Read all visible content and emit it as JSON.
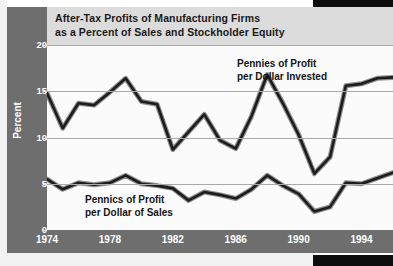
{
  "chart_title": "After-Tax Profits of Manufacturing Firms\nas a Percent of Sales and Stockholder Equity",
  "axis": {
    "y_title": "Percent",
    "y_ticks": [
      "0",
      "5",
      "10",
      "15",
      "20"
    ],
    "x_ticks": [
      "1974",
      "1978",
      "1982",
      "1986",
      "1990",
      "1994",
      "199"
    ]
  },
  "annotations": {
    "equity": "Pennies of Profit\nper Dollar Invested",
    "sales": "Pennics of Profit\nper Dollar of Sales"
  },
  "colors": {
    "panel_grey": "#6e6e6e",
    "title_strip": "#dcdcdc",
    "plot_background": "#fbfbfb",
    "gridline": "#a9a9a9",
    "line_dark": "#1c1c1c",
    "line_highlight": "#8c8c8c",
    "tick_text": "#ffffff",
    "title_text": "#1a1a1a"
  },
  "chart_data": {
    "type": "line",
    "title": "After-Tax Profits of Manufacturing Firms as a Percent of Sales and Stockholder Equity",
    "xlabel": "",
    "ylabel": "Percent",
    "ylim": [
      0,
      20
    ],
    "xlim": [
      1974,
      1996
    ],
    "grid": true,
    "legend": "annotations-in-plot",
    "x": [
      1974,
      1975,
      1976,
      1977,
      1978,
      1979,
      1980,
      1981,
      1982,
      1983,
      1984,
      1985,
      1986,
      1987,
      1988,
      1989,
      1990,
      1991,
      1992,
      1993,
      1994,
      1995,
      1996
    ],
    "series": [
      {
        "name": "Pennies of Profit per Dollar Invested",
        "values": [
          14.8,
          11.0,
          13.7,
          13.5,
          14.9,
          16.4,
          13.9,
          13.6,
          8.7,
          10.6,
          12.5,
          9.7,
          8.8,
          12.3,
          16.8,
          13.7,
          10.3,
          6.1,
          7.9,
          15.6,
          15.8,
          16.4,
          16.5
        ]
      },
      {
        "name": "Pennics of Profit per Dollar of Sales",
        "values": [
          5.5,
          4.4,
          5.1,
          4.9,
          5.1,
          5.9,
          5.0,
          4.8,
          4.5,
          3.2,
          4.1,
          3.8,
          3.4,
          4.4,
          5.9,
          4.8,
          3.9,
          2.0,
          2.5,
          5.1,
          5.0,
          5.6,
          6.2
        ]
      }
    ]
  }
}
